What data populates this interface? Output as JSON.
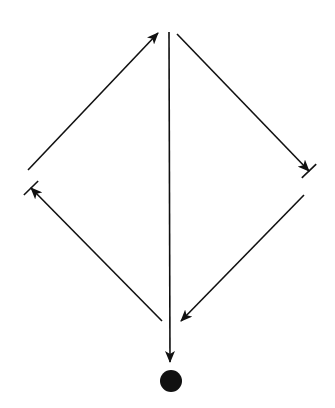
{
  "diagram": {
    "type": "directed-graph",
    "stroke_color": "#111111",
    "background": "#ffffff",
    "edges": [
      {
        "id": "left-upper",
        "from": [
          28,
          170
        ],
        "to": [
          158,
          33
        ],
        "head": "arrow",
        "tail_bar": false
      },
      {
        "id": "right-upper",
        "from": [
          177,
          34
        ],
        "to": [
          309,
          171
        ],
        "head": "arrow-bar"
      },
      {
        "id": "right-lower",
        "from": [
          304,
          195
        ],
        "to": [
          181,
          321
        ],
        "head": "arrow"
      },
      {
        "id": "left-lower",
        "from": [
          162,
          321
        ],
        "to": [
          31,
          188
        ],
        "head": "arrow-bar"
      },
      {
        "id": "center-vertical",
        "from": [
          169,
          32
        ],
        "to": [
          170,
          362
        ],
        "head": "arrow"
      }
    ],
    "terminal_node": {
      "cx": 171,
      "cy": 381,
      "r": 11,
      "fill": "#111111"
    }
  }
}
